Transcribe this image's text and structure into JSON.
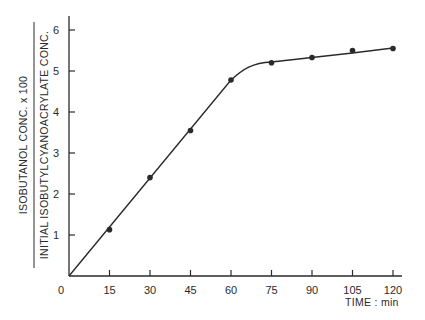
{
  "chart_data": {
    "type": "line",
    "title": "",
    "xlabel": "TIME : min",
    "ylabel": {
      "numerator": "ISOBUTANOL  CONC.  x  100",
      "denominator": "INITIAL  ISOBUTYLCYANOACRYLATE   CONC."
    },
    "x_ticks": [
      0,
      15,
      30,
      45,
      60,
      75,
      90,
      105,
      120
    ],
    "y_ticks": [
      1,
      2,
      3,
      4,
      5,
      6
    ],
    "origin_label": "0",
    "xlim": [
      0,
      120
    ],
    "ylim": [
      0,
      6
    ],
    "grid": false,
    "legend": null,
    "series": [
      {
        "name": "measured",
        "marker": "filled-circle",
        "x": [
          15,
          30,
          45,
          60,
          75,
          90,
          105,
          120
        ],
        "y": [
          1.13,
          2.4,
          3.55,
          4.78,
          5.2,
          5.33,
          5.5,
          5.55
        ]
      },
      {
        "name": "fitted curve",
        "style": "solid-line",
        "x": [
          0,
          15,
          30,
          45,
          60,
          66,
          70,
          75,
          90,
          105,
          120
        ],
        "y": [
          0,
          1.2,
          2.4,
          3.6,
          4.78,
          5.08,
          5.18,
          5.22,
          5.33,
          5.44,
          5.56
        ]
      }
    ]
  },
  "colors": {
    "ink": "#2a2a2a",
    "background": "#ffffff"
  }
}
